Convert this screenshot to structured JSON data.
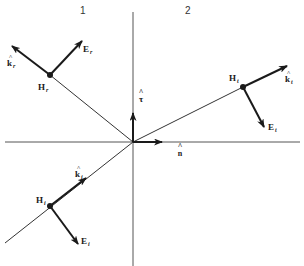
{
  "diagram": {
    "regions": [
      {
        "id": "region-1",
        "label": "1",
        "x": 80,
        "y": 14
      },
      {
        "id": "region-2",
        "label": "2",
        "x": 185,
        "y": 14
      }
    ],
    "axes": {
      "horizontal": {
        "x1": 5,
        "y1": 142,
        "x2": 300,
        "y2": 142
      },
      "vertical": {
        "x1": 133,
        "y1": 12,
        "x2": 133,
        "y2": 266
      },
      "color": "#555555"
    },
    "unit_vectors": {
      "n": {
        "label": "n",
        "hat": "^",
        "tip": [
          162,
          142
        ],
        "label_pos": [
          180,
          152
        ]
      },
      "tau": {
        "label": "τ",
        "hat": "^",
        "tip": [
          133,
          113
        ],
        "label_pos": [
          141,
          98
        ]
      }
    },
    "rays": {
      "incident": {
        "from": [
          5,
          243
        ],
        "to": [
          133,
          142
        ]
      },
      "reflected": {
        "from": [
          133,
          142
        ],
        "to": [
          50,
          75
        ]
      },
      "transmitted": {
        "from": [
          133,
          142
        ],
        "to": [
          243,
          87
        ]
      }
    },
    "waves": [
      {
        "id": "incident",
        "point": [
          50,
          206
        ],
        "H_label": "H",
        "H_sub": "i",
        "H_label_pos": [
          36,
          203
        ],
        "k_label": "k",
        "k_sub": "i",
        "k_tip": [
          86,
          178
        ],
        "k_label_pos": [
          75,
          177
        ],
        "E_label": "E",
        "E_sub": "i",
        "E_tip": [
          78,
          244
        ],
        "E_label_pos": [
          81,
          244
        ]
      },
      {
        "id": "reflected",
        "point": [
          50,
          75
        ],
        "H_label": "H",
        "H_sub": "r",
        "H_label_pos": [
          38,
          90
        ],
        "k_label": "k",
        "k_sub": "r",
        "k_tip": [
          12,
          46
        ],
        "k_label_pos": [
          7,
          66
        ],
        "E_label": "E",
        "E_sub": "r",
        "E_tip": [
          82,
          41
        ],
        "E_label_pos": [
          83,
          52
        ]
      },
      {
        "id": "transmitted",
        "point": [
          243,
          87
        ],
        "H_label": "H",
        "H_sub": "t",
        "H_label_pos": [
          229,
          81
        ],
        "k_label": "k",
        "k_sub": "t",
        "k_tip": [
          287,
          66
        ],
        "k_label_pos": [
          285,
          82
        ],
        "E_label": "E",
        "E_sub": "t",
        "E_tip": [
          264,
          127
        ],
        "E_label_pos": [
          268,
          130
        ]
      }
    ],
    "colors": {
      "vector": "#1a1a1a",
      "line": "#333333",
      "axis": "#555555",
      "background": "#ffffff"
    }
  }
}
